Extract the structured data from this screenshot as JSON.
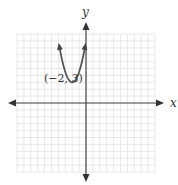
{
  "chart_data": {
    "type": "line",
    "title": "",
    "xlabel": "x",
    "ylabel": "y",
    "xlim": [
      -10,
      10
    ],
    "ylim": [
      -10,
      10
    ],
    "grid": true,
    "series": [
      {
        "name": "parabola",
        "description": "Upward-opening parabola with vertex at (-2, 3), arrows at both ends",
        "vertex": [
          -2,
          3
        ],
        "x": [
          -4,
          -3,
          -2,
          -1,
          0
        ],
        "y": [
          9,
          4.5,
          3,
          4.5,
          9
        ]
      }
    ],
    "annotations": [
      {
        "text": "(−2, 3)",
        "x": -2,
        "y": 3
      }
    ]
  },
  "labels": {
    "x_axis": "x",
    "y_axis": "y",
    "vertex_label": "(−2, 3)"
  }
}
